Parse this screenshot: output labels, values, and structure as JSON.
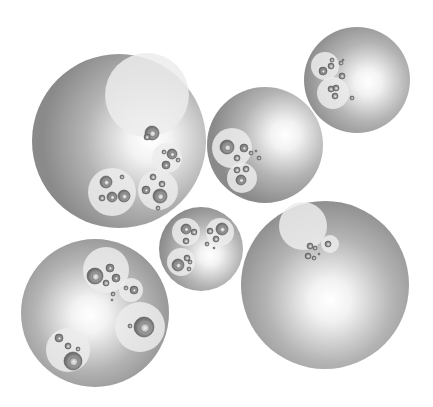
{
  "diagram": {
    "type": "circle-packing",
    "width": 433,
    "height": 407,
    "background": "#ffffff",
    "colors": {
      "outer_edge": "#8a8a8a",
      "outer_center": "#ffffff",
      "group_fill": "#ececec",
      "leaf_edge": "#5a5a5a",
      "leaf_mid": "#9a9a9a",
      "leaf_center": "#f4f4f4"
    },
    "roots": [
      {
        "name": "root-top-left",
        "cx": 119,
        "cy": 141,
        "r": 87,
        "hx": 150,
        "hy": 140,
        "groups": [
          {
            "cx": 147,
            "cy": 95,
            "r": 42,
            "leaves": [
              [
                152,
                133,
                7
              ],
              [
                147,
                137,
                3
              ]
            ]
          },
          {
            "cx": 167,
            "cy": 158,
            "r": 15,
            "leaves": [
              [
                172,
                154,
                5
              ],
              [
                166,
                165,
                4
              ],
              [
                164,
                152,
                2
              ],
              [
                178,
                160,
                2
              ]
            ]
          },
          {
            "cx": 112,
            "cy": 192,
            "r": 24,
            "leaves": [
              [
                106,
                182,
                6
              ],
              [
                124,
                196,
                6
              ],
              [
                112,
                197,
                5
              ],
              [
                122,
                177,
                2
              ],
              [
                102,
                198,
                3
              ]
            ]
          },
          {
            "cx": 158,
            "cy": 190,
            "r": 20,
            "leaves": [
              [
                160,
                196,
                7
              ],
              [
                146,
                190,
                4
              ],
              [
                153,
                177,
                3
              ],
              [
                162,
                184,
                3
              ],
              [
                158,
                208,
                2
              ]
            ]
          }
        ]
      },
      {
        "name": "root-middle-upper",
        "cx": 265,
        "cy": 145,
        "r": 58,
        "hx": 285,
        "hy": 135,
        "groups": [
          {
            "cx": 232,
            "cy": 148,
            "r": 20,
            "leaves": [
              [
                227,
                147,
                7
              ],
              [
                244,
                148,
                4
              ],
              [
                237,
                158,
                3
              ]
            ]
          },
          {
            "cx": 242,
            "cy": 178,
            "r": 15,
            "leaves": [
              [
                241,
                180,
                5
              ],
              [
                246,
                169,
                3
              ],
              [
                237,
                170,
                3
              ]
            ]
          }
        ],
        "loose": [
          [
            251,
            153,
            2
          ],
          [
            259,
            158,
            2
          ],
          [
            256,
            151,
            1
          ]
        ]
      },
      {
        "name": "root-top-right",
        "cx": 357,
        "cy": 80,
        "r": 53,
        "hx": 368,
        "hy": 82,
        "groups": [
          {
            "cx": 325,
            "cy": 66,
            "r": 14,
            "leaves": [
              [
                323,
                71,
                4
              ],
              [
                331,
                66,
                3
              ],
              [
                332,
                60,
                2
              ]
            ]
          },
          {
            "cx": 333,
            "cy": 93,
            "r": 16,
            "leaves": [
              [
                331,
                89,
                3
              ],
              [
                336,
                88,
                3
              ],
              [
                335,
                96,
                3
              ]
            ]
          }
        ],
        "loose": [
          [
            341,
            63,
            2
          ],
          [
            342,
            76,
            3
          ],
          [
            352,
            98,
            2
          ],
          [
            343,
            60,
            1
          ]
        ]
      },
      {
        "name": "root-middle-small",
        "cx": 201,
        "cy": 249,
        "r": 42,
        "hx": 210,
        "hy": 255,
        "groups": [
          {
            "cx": 186,
            "cy": 232,
            "r": 14,
            "leaves": [
              [
                186,
                229,
                5
              ],
              [
                194,
                232,
                3
              ],
              [
                186,
                241,
                3
              ]
            ]
          },
          {
            "cx": 220,
            "cy": 232,
            "r": 14,
            "leaves": [
              [
                222,
                229,
                6
              ],
              [
                210,
                231,
                3
              ],
              [
                216,
                239,
                3
              ]
            ]
          },
          {
            "cx": 181,
            "cy": 262,
            "r": 14,
            "leaves": [
              [
                178,
                265,
                6
              ],
              [
                187,
                258,
                3
              ],
              [
                190,
                262,
                2
              ],
              [
                189,
                269,
                2
              ]
            ]
          }
        ],
        "loose": [
          [
            207,
            244,
            2
          ],
          [
            214,
            248,
            1
          ]
        ]
      },
      {
        "name": "root-bottom-right",
        "cx": 325,
        "cy": 285,
        "r": 84,
        "hx": 330,
        "hy": 300,
        "groups": [
          {
            "cx": 303,
            "cy": 226,
            "r": 24,
            "leaves": []
          },
          {
            "cx": 330,
            "cy": 244,
            "r": 9,
            "leaves": [
              [
                328,
                244,
                3
              ]
            ]
          }
        ],
        "loose": [
          [
            310,
            246,
            3
          ],
          [
            315,
            248,
            2
          ],
          [
            308,
            256,
            3
          ],
          [
            314,
            258,
            2
          ],
          [
            319,
            254,
            1
          ]
        ]
      },
      {
        "name": "root-bottom-left",
        "cx": 95,
        "cy": 313,
        "r": 74,
        "hx": 90,
        "hy": 315,
        "groups": [
          {
            "cx": 106,
            "cy": 270,
            "r": 23,
            "leaves": [
              [
                95,
                276,
                8
              ],
              [
                110,
                268,
                4
              ],
              [
                116,
                278,
                4
              ],
              [
                106,
                283,
                3
              ]
            ]
          },
          {
            "cx": 131,
            "cy": 290,
            "r": 12,
            "leaves": [
              [
                134,
                290,
                4
              ],
              [
                126,
                288,
                2
              ]
            ]
          },
          {
            "cx": 140,
            "cy": 327,
            "r": 25,
            "leaves": [
              [
                144,
                327,
                10
              ],
              [
                130,
                326,
                2
              ]
            ]
          },
          {
            "cx": 68,
            "cy": 350,
            "r": 22,
            "leaves": [
              [
                73,
                361,
                9
              ],
              [
                59,
                338,
                4
              ],
              [
                68,
                346,
                3
              ],
              [
                78,
                349,
                2
              ]
            ]
          }
        ],
        "loose": [
          [
            113,
            294,
            2
          ],
          [
            112,
            300,
            1
          ]
        ]
      }
    ]
  }
}
